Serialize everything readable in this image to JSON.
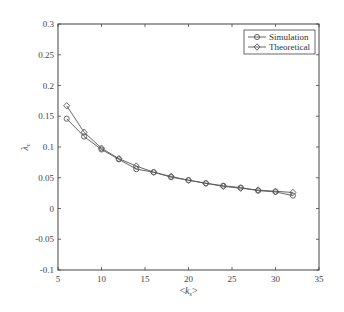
{
  "chart_data": {
    "type": "line",
    "title": "",
    "xlabel": "<k_s>",
    "ylabel": "λ_c",
    "xlim": [
      5,
      35
    ],
    "ylim": [
      -0.1,
      0.3
    ],
    "xticks": [
      "5",
      "10",
      "15",
      "20",
      "25",
      "30",
      "35"
    ],
    "yticks": [
      "-0.1",
      "-0.05",
      "0",
      "0.05",
      "0.1",
      "0.15",
      "0.2",
      "0.25",
      "0.3"
    ],
    "grid": false,
    "legend_position": "upper right",
    "x": [
      6,
      8,
      10,
      12,
      14,
      16,
      18,
      20,
      22,
      24,
      26,
      28,
      30,
      32
    ],
    "series": [
      {
        "name": "Simulation",
        "marker": "circle",
        "values": [
          0.146,
          0.117,
          0.096,
          0.08,
          0.064,
          0.059,
          0.051,
          0.046,
          0.041,
          0.037,
          0.034,
          0.029,
          0.027,
          0.021
        ]
      },
      {
        "name": "Theoretical",
        "marker": "diamond",
        "values": [
          0.167,
          0.124,
          0.098,
          0.081,
          0.069,
          0.059,
          0.052,
          0.046,
          0.041,
          0.036,
          0.033,
          0.03,
          0.028,
          0.026
        ]
      }
    ]
  },
  "colors": {
    "line": "#555555",
    "axis": "#444444"
  }
}
